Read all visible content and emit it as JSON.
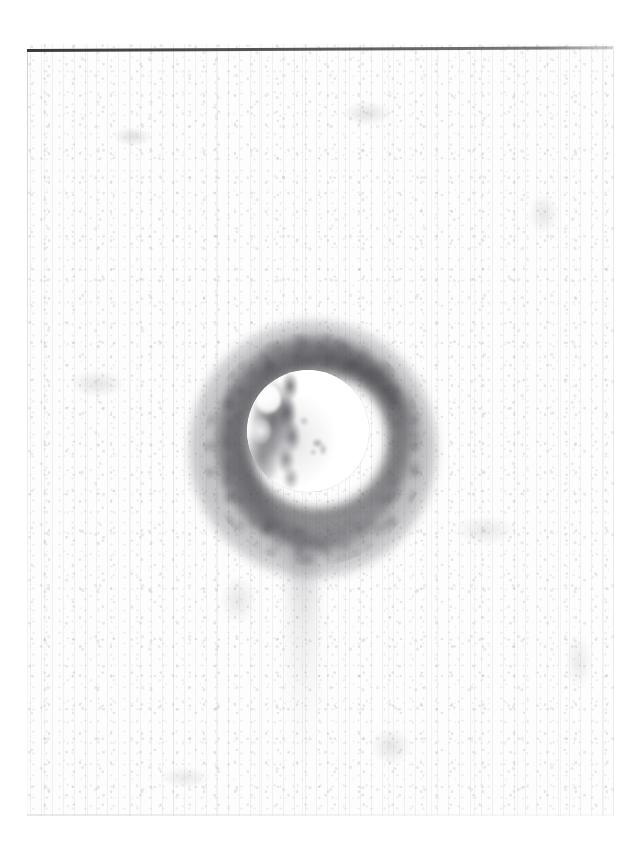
{
  "page": {
    "width": 639,
    "height": 859,
    "background_color": "#ffffff",
    "caption": "Scanned archival photographic plate"
  },
  "sheet": {
    "name": "scanned-plate-sheet",
    "left": 27,
    "top": 44,
    "width": 587,
    "height": 772,
    "paper_color": "#fdfdfd",
    "grain_color": "#969aa0"
  },
  "rule": {
    "name": "top-horizontal-rule",
    "color": "#3a3a40",
    "left": 27,
    "top": 49,
    "width": 586,
    "thickness": 3,
    "slope_degrees": -0.28
  },
  "subject": {
    "label": "bright circular celestial disc",
    "type": "disc",
    "center_x": 307,
    "center_y": 431,
    "radius": 61,
    "fill_color": "#ffffff",
    "markings": [
      {
        "name": "dark-limb-marking",
        "position": "left",
        "color": "#3a3a40"
      },
      {
        "name": "dark-ridge-marking",
        "position": "left-center",
        "color": "#34343a"
      },
      {
        "name": "bright-highlight",
        "position": "upper-left",
        "color": "#ffffff"
      },
      {
        "name": "central-smudge",
        "position": "center",
        "color": "#6e6e76"
      }
    ]
  },
  "halo": {
    "label": "dark diffuse corona surrounding the disc",
    "center_x": 303,
    "center_y": 433,
    "outer_radius_x": 124,
    "outer_radius_y": 129,
    "darkest_color": "#3a3a3f",
    "mid_color": "#6e6e76",
    "fade_color": "#c8c8cd"
  },
  "artifacts": {
    "smudge_tail": {
      "name": "vertical-smudge-trail",
      "left": 289,
      "top": 544,
      "width": 28,
      "height": 230,
      "color": "#7a7a82"
    },
    "plate_edges": {
      "left_color": "#aaacb2",
      "right_color": "#c8cad0",
      "bottom_color": "#cdcfd4"
    }
  }
}
